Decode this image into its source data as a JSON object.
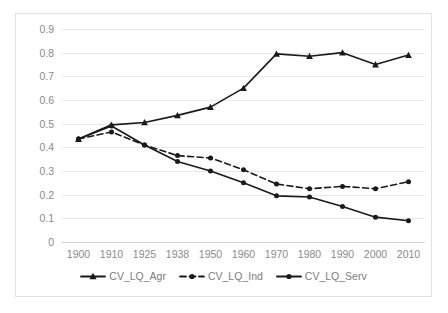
{
  "chart_data": {
    "type": "line",
    "title": "",
    "xlabel": "",
    "ylabel": "",
    "categories": [
      "1900",
      "1910",
      "1925",
      "1938",
      "1950",
      "1960",
      "1970",
      "1980",
      "1990",
      "2000",
      "2010"
    ],
    "ylim": [
      0,
      0.9
    ],
    "ytick_labels": [
      "0.9",
      "0.8",
      "0.7",
      "0.6",
      "0.5",
      "0.4",
      "0.3",
      "0.2",
      "0.1",
      "0"
    ],
    "ytick_values": [
      0.9,
      0.8,
      0.7,
      0.6,
      0.5,
      0.4,
      0.3,
      0.2,
      0.1,
      0
    ],
    "grid": true,
    "legend_position": "bottom",
    "series": [
      {
        "name": "CV_LQ_Agr",
        "marker": "triangle",
        "dash": false,
        "color": "#1a1a1a",
        "values": [
          0.435,
          0.495,
          0.505,
          0.535,
          0.57,
          0.65,
          0.795,
          0.785,
          0.8,
          0.75,
          0.79
        ]
      },
      {
        "name": "CV_LQ_Ind",
        "marker": "circle",
        "dash": true,
        "color": "#1a1a1a",
        "values": [
          0.435,
          0.465,
          0.41,
          0.365,
          0.355,
          0.305,
          0.245,
          0.225,
          0.235,
          0.225,
          0.255
        ]
      },
      {
        "name": "CV_LQ_Serv",
        "marker": "circle",
        "dash": false,
        "color": "#1a1a1a",
        "values": [
          0.435,
          0.49,
          0.41,
          0.34,
          0.3,
          0.25,
          0.195,
          0.19,
          0.15,
          0.105,
          0.09
        ]
      }
    ]
  },
  "legend": {
    "items": [
      {
        "label": "CV_LQ_Agr"
      },
      {
        "label": "CV_LQ_Ind"
      },
      {
        "label": "CV_LQ_Serv"
      }
    ]
  }
}
